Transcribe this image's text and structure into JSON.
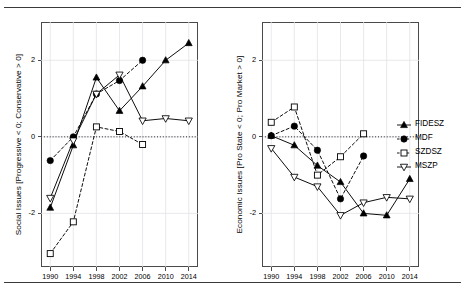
{
  "figure": {
    "kind": "two-panel-line-chart",
    "rules": [
      "top-rule",
      "bottom-rule"
    ]
  },
  "legend": {
    "position": "right",
    "entries": [
      {
        "label": "FIDESZ",
        "marker": "filled-triangle-up",
        "line": "solid",
        "color": "#000000"
      },
      {
        "label": "MDF",
        "marker": "filled-circle",
        "line": "dashed",
        "color": "#000000"
      },
      {
        "label": "SZDSZ",
        "marker": "open-square",
        "line": "dashed",
        "color": "#000000"
      },
      {
        "label": "MSZP",
        "marker": "open-triangle-down",
        "line": "solid",
        "color": "#000000"
      }
    ]
  },
  "chart_data": [
    {
      "panel": "left",
      "type": "line",
      "title": "",
      "xlabel": "",
      "ylabel": "Social Issues [Progressive < 0; Conservative > 0]",
      "x": [
        1990,
        1994,
        1998,
        2002,
        2006,
        2010,
        2014
      ],
      "xticks": [
        "1990",
        "1994",
        "1998",
        "2002",
        "2006",
        "2010",
        "2014"
      ],
      "yticks": [
        "2",
        "0",
        "-2"
      ],
      "ytickvals": [
        2,
        0,
        -2
      ],
      "xlim": [
        1988.4,
        2015.6
      ],
      "ylim": [
        -3.4,
        3.0
      ],
      "grid": true,
      "zeroline": true,
      "series": [
        {
          "name": "FIDESZ",
          "x": [
            1990,
            1994,
            1998,
            2002,
            2006,
            2010,
            2014
          ],
          "values": [
            -1.85,
            -0.22,
            1.55,
            0.68,
            1.32,
            2.0,
            2.45
          ]
        },
        {
          "name": "MDF",
          "x": [
            1990,
            1994,
            1998,
            2002,
            2006
          ],
          "values": [
            -0.62,
            0.0,
            1.12,
            1.47,
            2.0
          ]
        },
        {
          "name": "SZDSZ",
          "x": [
            1990,
            1994,
            1998,
            2002,
            2006
          ],
          "values": [
            -3.05,
            -2.22,
            0.26,
            0.14,
            -0.2
          ]
        },
        {
          "name": "MSZP",
          "x": [
            1990,
            1994,
            1998,
            2002,
            2006,
            2010,
            2014
          ],
          "values": [
            -1.6,
            -0.1,
            1.12,
            1.62,
            0.42,
            0.48,
            0.42
          ]
        }
      ]
    },
    {
      "panel": "right",
      "type": "line",
      "title": "",
      "xlabel": "",
      "ylabel": "Economic Issues [Pro State < 0; Pro Market > 0]",
      "x": [
        1990,
        1994,
        1998,
        2002,
        2006,
        2010,
        2014
      ],
      "xticks": [
        "1990",
        "1994",
        "1998",
        "2002",
        "2006",
        "2010",
        "2014"
      ],
      "yticks": [
        "2",
        "0",
        "-2"
      ],
      "ytickvals": [
        2,
        0,
        -2
      ],
      "xlim": [
        1988.4,
        2015.6
      ],
      "ylim": [
        -3.4,
        3.0
      ],
      "grid": true,
      "zeroline": true,
      "series": [
        {
          "name": "FIDESZ",
          "x": [
            1990,
            1994,
            1998,
            2002,
            2006,
            2010,
            2014
          ],
          "values": [
            0.03,
            -0.22,
            -0.75,
            -1.18,
            -2.0,
            -2.05,
            -1.1
          ]
        },
        {
          "name": "MDF",
          "x": [
            1990,
            1994,
            1998,
            2002,
            2006
          ],
          "values": [
            0.03,
            0.28,
            -0.35,
            -1.62,
            -0.5
          ]
        },
        {
          "name": "SZDSZ",
          "x": [
            1990,
            1994,
            1998,
            2002,
            2006
          ],
          "values": [
            0.38,
            0.78,
            -1.0,
            -0.52,
            0.08
          ]
        },
        {
          "name": "MSZP",
          "x": [
            1990,
            1994,
            1998,
            2002,
            2006,
            2010,
            2014
          ],
          "values": [
            -0.3,
            -1.05,
            -1.3,
            -2.05,
            -1.72,
            -1.58,
            -1.62
          ]
        }
      ]
    }
  ]
}
